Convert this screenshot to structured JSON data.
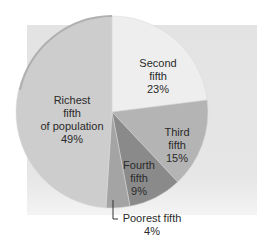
{
  "chart_data": {
    "type": "pie",
    "title": "",
    "categories": [
      "Second fifth",
      "Third fifth",
      "Fourth fifth",
      "Poorest fifth",
      "Richest fifth of population"
    ],
    "values": [
      23,
      15,
      9,
      4,
      49
    ],
    "unit": "%",
    "start_angle_deg": 0,
    "direction": "clockwise",
    "colors": [
      "#eeeeee",
      "#b4b4b4",
      "#8a8a8a",
      "#a4a4a4",
      "#cdcdcd"
    ]
  },
  "labels": {
    "second": {
      "line1": "Second",
      "line2": "fifth",
      "pct": "23%"
    },
    "third": {
      "line1": "Third",
      "line2": "fifth",
      "pct": "15%"
    },
    "fourth": {
      "line1": "Fourth",
      "line2": "fifth",
      "pct": "9%"
    },
    "poorest": {
      "line1": "Poorest fifth",
      "pct": "4%"
    },
    "richest": {
      "line1": "Richest",
      "line2": "fifth",
      "line3": "of population",
      "pct": "49%"
    }
  }
}
